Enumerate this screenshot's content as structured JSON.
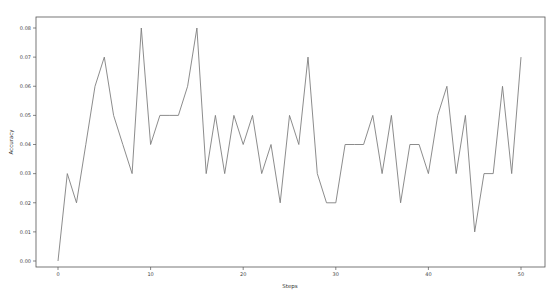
{
  "chart_data": {
    "type": "line",
    "title": "",
    "xlabel": "Steps",
    "ylabel": "Accuracy",
    "xlim": [
      -2.5,
      52.5
    ],
    "ylim": [
      -0.004,
      0.084
    ],
    "grid": false,
    "legend": null,
    "x_ticks": [
      0,
      10,
      20,
      30,
      40,
      50
    ],
    "x_tick_labels": [
      "0",
      "10",
      "20",
      "30",
      "40",
      "50"
    ],
    "y_ticks": [
      0.0,
      0.01,
      0.02,
      0.03,
      0.04,
      0.05,
      0.06,
      0.07,
      0.08
    ],
    "y_tick_labels": [
      "0.00",
      "0.01",
      "0.02",
      "0.03",
      "0.04",
      "0.05",
      "0.06",
      "0.07",
      "0.08"
    ],
    "line_color": "#7f7f7f",
    "series": [
      {
        "name": "Accuracy",
        "x": [
          0,
          1,
          2,
          3,
          4,
          5,
          6,
          7,
          8,
          9,
          10,
          11,
          12,
          13,
          14,
          15,
          16,
          17,
          18,
          19,
          20,
          21,
          22,
          23,
          24,
          25,
          26,
          27,
          28,
          29,
          30,
          31,
          32,
          33,
          34,
          35,
          36,
          37,
          38,
          39,
          40,
          41,
          42,
          43,
          44,
          45,
          46,
          47,
          48,
          49,
          50
        ],
        "values": [
          0.0,
          0.03,
          0.02,
          0.04,
          0.06,
          0.07,
          0.05,
          0.04,
          0.03,
          0.08,
          0.04,
          0.05,
          0.05,
          0.05,
          0.06,
          0.08,
          0.03,
          0.05,
          0.03,
          0.05,
          0.04,
          0.05,
          0.03,
          0.04,
          0.02,
          0.05,
          0.04,
          0.07,
          0.03,
          0.02,
          0.02,
          0.04,
          0.04,
          0.04,
          0.05,
          0.03,
          0.05,
          0.02,
          0.04,
          0.04,
          0.03,
          0.05,
          0.06,
          0.03,
          0.05,
          0.01,
          0.03,
          0.03,
          0.06,
          0.03,
          0.07
        ]
      }
    ]
  }
}
